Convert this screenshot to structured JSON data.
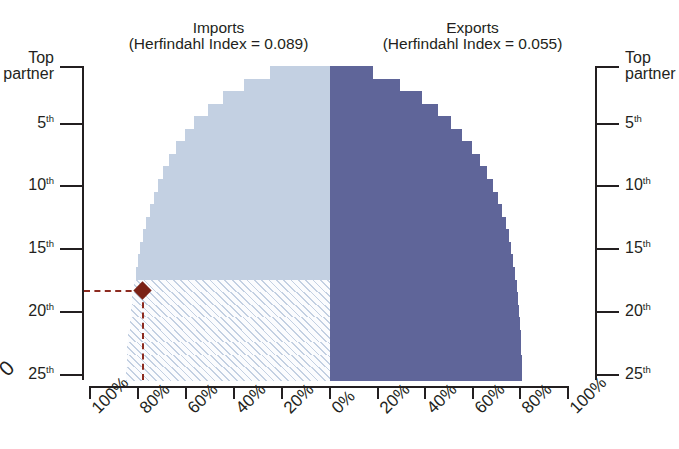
{
  "panels": {
    "imports": {
      "name": "Imports",
      "subtitle": "(Herfindahl Index = 0.089)",
      "color": "#c3d0e2"
    },
    "exports": {
      "name": "Exports",
      "subtitle": "(Herfindahl Index = 0.055)",
      "color": "#5f6599"
    }
  },
  "ghost": {
    "top_clipped_text": "",
    "left_clipped_label": "0"
  },
  "axes": {
    "y_left_title": "Top partner",
    "y_right_title": "Top partner",
    "y_ticks": [
      "Top partner",
      "5th",
      "10th",
      "15th",
      "20th",
      "25th"
    ],
    "y_tick_values": [
      1,
      5,
      10,
      15,
      20,
      25
    ],
    "x_ticks_left": [
      "100%",
      "80%",
      "60%",
      "40%",
      "20%",
      "0%"
    ],
    "x_ticks_right": [
      "0%",
      "20%",
      "40%",
      "60%",
      "80%",
      "100%"
    ]
  },
  "annotation": {
    "color": "#8d2b20",
    "marker_color": "#7b2216",
    "y_rank": 18,
    "x_percent": 78,
    "label": ""
  },
  "chart_data": {
    "type": "bar",
    "title": "",
    "subtitle": "",
    "orientation": "horizontal-diverging",
    "xlabel": "",
    "ylabel": "Top partner",
    "xlim": [
      -100,
      100
    ],
    "ylim": [
      1,
      25
    ],
    "grid": false,
    "legend_position": "top",
    "categories": [
      "Top partner",
      "2nd",
      "3rd",
      "4th",
      "5th",
      "6th",
      "7th",
      "8th",
      "9th",
      "10th",
      "11th",
      "12th",
      "13th",
      "14th",
      "15th",
      "16th",
      "17th",
      "18th",
      "19th",
      "20th",
      "21st",
      "22nd",
      "23rd",
      "24th",
      "25th"
    ],
    "series": [
      {
        "name": "Imports",
        "herfindahl_index": 0.089,
        "color": "#c3d0e2",
        "direction": "left",
        "values": [
          25.0,
          36.0,
          44.5,
          51.0,
          56.5,
          60.5,
          64.0,
          67.0,
          69.5,
          71.5,
          73.5,
          75.0,
          76.5,
          77.8,
          79.0,
          80.0,
          80.9,
          81.7,
          82.4,
          83.0,
          83.5,
          84.0,
          84.4,
          84.7,
          85.0
        ]
      },
      {
        "name": "Exports",
        "herfindahl_index": 0.055,
        "color": "#5f6599",
        "direction": "right",
        "values": [
          18.0,
          29.5,
          38.5,
          45.5,
          51.0,
          55.5,
          59.5,
          63.0,
          66.0,
          68.5,
          70.5,
          72.3,
          73.8,
          75.0,
          76.0,
          77.0,
          77.8,
          78.4,
          79.0,
          79.4,
          79.8,
          80.1,
          80.3,
          80.5,
          80.6
        ]
      }
    ],
    "annotations": [
      {
        "type": "marker",
        "shape": "diamond",
        "category": "18th",
        "value": 78,
        "series": "Imports",
        "color": "#7b2216",
        "note": "dashed guide lines to left axis and bottom axis"
      },
      {
        "type": "hatch-region",
        "description": "Imports cumulative share below the 18th partner shown with diagonal hatching",
        "from_category": "18th",
        "to_category": "25th"
      }
    ]
  }
}
